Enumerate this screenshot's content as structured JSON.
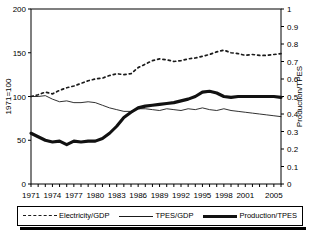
{
  "chart_data": {
    "type": "line",
    "title": "",
    "xlabel": "",
    "ylabel": "1971=100",
    "y2label": "Production/TPES",
    "xlim": [
      1971,
      2006
    ],
    "ylim": [
      0,
      200
    ],
    "y2lim": [
      0,
      1
    ],
    "grid": false,
    "legend_position": "bottom",
    "xticks": [
      "1971",
      "1974",
      "1977",
      "1980",
      "1983",
      "1986",
      "1989",
      "1992",
      "1995",
      "1998",
      "2001",
      "2005"
    ],
    "xtick_values": [
      1971,
      1974,
      1977,
      1980,
      1983,
      1986,
      1989,
      1992,
      1995,
      1998,
      2001,
      2005
    ],
    "yticks": [
      "0",
      "50",
      "100",
      "150",
      "200"
    ],
    "ytick_values": [
      0,
      50,
      100,
      150,
      200
    ],
    "y2ticks": [
      "0",
      "0.1",
      "0.2",
      "0.3",
      "0.4",
      "0.5",
      "0.6",
      "0.7",
      "0.8",
      "0.9",
      "1"
    ],
    "y2tick_values": [
      0,
      0.1,
      0.2,
      0.3,
      0.4,
      0.5,
      0.6,
      0.7,
      0.8,
      0.9,
      1
    ],
    "x": [
      1971,
      1972,
      1973,
      1974,
      1975,
      1976,
      1977,
      1978,
      1979,
      1980,
      1981,
      1982,
      1983,
      1984,
      1985,
      1986,
      1987,
      1988,
      1989,
      1990,
      1991,
      1992,
      1993,
      1994,
      1995,
      1996,
      1997,
      1998,
      1999,
      2000,
      2001,
      2002,
      2003,
      2004,
      2005,
      2006
    ],
    "series": [
      {
        "name": "Electricity/GDP",
        "axis": "left",
        "style": "dashed",
        "color": "#1a1a1a",
        "values": [
          100,
          102,
          105,
          103,
          107,
          110,
          112,
          115,
          118,
          120,
          121,
          124,
          126,
          125,
          126,
          133,
          137,
          141,
          143,
          142,
          140,
          141,
          143,
          144,
          146,
          148,
          151,
          153,
          150,
          149,
          147,
          148,
          147,
          147,
          148,
          149
        ]
      },
      {
        "name": "TPES/GDP",
        "axis": "left",
        "style": "thin",
        "color": "#1a1a1a",
        "values": [
          100,
          100,
          101,
          97,
          94,
          95,
          93,
          93,
          94,
          93,
          90,
          87,
          85,
          83,
          83,
          86,
          86,
          85,
          84,
          86,
          85,
          84,
          86,
          85,
          87,
          85,
          84,
          86,
          84,
          83,
          82,
          81,
          80,
          79,
          78,
          77
        ]
      },
      {
        "name": "Production/TPES",
        "axis": "right",
        "style": "thick",
        "color": "#111111",
        "values": [
          0.29,
          0.27,
          0.25,
          0.24,
          0.245,
          0.225,
          0.245,
          0.24,
          0.245,
          0.245,
          0.26,
          0.29,
          0.33,
          0.38,
          0.41,
          0.435,
          0.445,
          0.45,
          0.455,
          0.46,
          0.465,
          0.475,
          0.485,
          0.5,
          0.525,
          0.53,
          0.52,
          0.5,
          0.495,
          0.5,
          0.5,
          0.5,
          0.5,
          0.5,
          0.5,
          0.495
        ]
      }
    ]
  },
  "legend": {
    "items": [
      {
        "label": "Electricity/GDP",
        "style": "dashed"
      },
      {
        "label": "TPES/GDP",
        "style": "thin"
      },
      {
        "label": "Production/TPES",
        "style": "thick"
      }
    ]
  }
}
